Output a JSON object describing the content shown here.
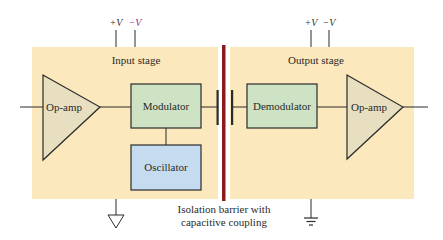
{
  "diagram": {
    "type": "isolation-amplifier-block-diagram",
    "colors": {
      "panel": "#fbe8bd",
      "barrier": "#8c1a1a",
      "opamp_fill": "#e8dfc0",
      "modulator_fill": "#cde3c3",
      "oscillator_fill": "#c5dcf0",
      "stroke": "#2b2b2b",
      "minus_v_accent": "#9b2b8a"
    },
    "input_stage": {
      "title": "Input stage",
      "supply_plus": "+V",
      "supply_minus": "−V",
      "opamp_label": "Op-amp",
      "modulator_label": "Modulator",
      "oscillator_label": "Oscillator"
    },
    "output_stage": {
      "title": "Output stage",
      "supply_plus": "+V",
      "supply_minus": "−V",
      "demodulator_label": "Demodulator",
      "opamp_label": "Op-amp"
    },
    "barrier": {
      "caption_line1": "Isolation barrier with",
      "caption_line2": "capacitive coupling"
    },
    "grounds": {
      "input": "floating-ground-triangle",
      "output": "earth-ground"
    }
  }
}
